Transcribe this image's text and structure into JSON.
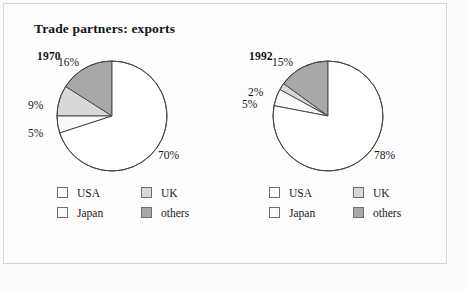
{
  "title": "Trade partners: exports",
  "colors": {
    "usa": "#ffffff",
    "japan": "#fafafa",
    "uk": "#d8d8d8",
    "others": "#a8a8a8",
    "outline": "#4a4a4a",
    "text": "#191919",
    "frame": "#d6d6d6",
    "background": "#fdfdfd"
  },
  "legend": {
    "usa": "USA",
    "uk": "UK",
    "japan": "Japan",
    "others": "others"
  },
  "chart_data": [
    {
      "type": "pie",
      "title": "1970",
      "categories": [
        "USA",
        "Japan",
        "UK",
        "others"
      ],
      "values": [
        70,
        9,
        5,
        16
      ],
      "labels": {
        "usa": "70%",
        "japan": "5%",
        "uk": "9%",
        "others": "16%"
      },
      "start_angle_deg": 90,
      "direction": "counterclockwise",
      "slice_order": [
        "others",
        "uk",
        "japan",
        "usa"
      ],
      "slice_values_in_order": [
        16,
        9,
        5,
        70
      ],
      "units": "percent"
    },
    {
      "type": "pie",
      "title": "1992",
      "categories": [
        "USA",
        "Japan",
        "UK",
        "others"
      ],
      "values": [
        78,
        2,
        5,
        15
      ],
      "labels": {
        "usa": "78%",
        "japan": "5%",
        "uk": "2%",
        "others": "15%"
      },
      "start_angle_deg": 90,
      "direction": "counterclockwise",
      "slice_order": [
        "others",
        "uk",
        "japan",
        "usa"
      ],
      "slice_values_in_order": [
        15,
        2,
        5,
        78
      ],
      "units": "percent"
    }
  ]
}
